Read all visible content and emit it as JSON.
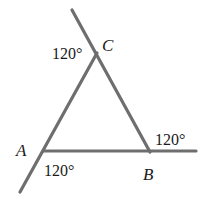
{
  "diagram": {
    "type": "triangle-exterior-angles",
    "stroke_color": "#6e6e6e",
    "text_color": "#1a1a1a",
    "vertices": {
      "A": {
        "label": "A",
        "x": 43,
        "y": 151
      },
      "B": {
        "label": "B",
        "x": 150,
        "y": 152
      },
      "C": {
        "label": "C",
        "x": 97,
        "y": 53
      }
    },
    "extensions": {
      "through_C": {
        "x1": 72,
        "y1": 10,
        "x2": 150,
        "y2": 152
      },
      "through_A": {
        "x1": 97,
        "y1": 53,
        "x2": 20,
        "y2": 192
      },
      "through_B": {
        "x1": 43,
        "y1": 151,
        "x2": 196,
        "y2": 151
      }
    },
    "angle_labels": {
      "at_C": "120°",
      "at_A": "120°",
      "at_B": "120°"
    }
  }
}
